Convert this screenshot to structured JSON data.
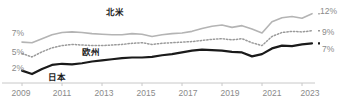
{
  "chart_data": {
    "type": "line",
    "title": "",
    "xlabel": "",
    "ylabel": "",
    "grid": false,
    "legend_position": "inline-annotations",
    "x": [
      2009,
      2009.5,
      2010,
      2010.5,
      2011,
      2011.5,
      2012,
      2012.5,
      2013,
      2013.5,
      2014,
      2014.5,
      2015,
      2015.5,
      2016,
      2016.5,
      2017,
      2017.5,
      2018,
      2018.5,
      2019,
      2019.5,
      2020,
      2020.5,
      2021,
      2021.5,
      2022,
      2022.5,
      2023,
      2023.5
    ],
    "xlim": [
      2009,
      2023.8
    ],
    "ylim": [
      0,
      13
    ],
    "x_tick_labels": [
      "2009",
      "2011",
      "2013",
      "2015",
      "2017",
      "2019",
      "2021",
      "2023"
    ],
    "x_tick_values": [
      2009,
      2011,
      2013,
      2015,
      2017,
      2019,
      2021,
      2023
    ],
    "y_axis_left_labels": [
      "7%",
      "5%",
      "2%"
    ],
    "y_axis_left_values": [
      7,
      5,
      2
    ],
    "y_axis_right_labels": [
      "12%",
      "9%",
      "7%"
    ],
    "y_axis_right_values": [
      12,
      9,
      7
    ],
    "series": [
      {
        "name": "北米",
        "label": "北米",
        "style": "solid",
        "color": "#b4b4b4",
        "width": 1.6,
        "end_label": "12%",
        "values": [
          7.0,
          6.9,
          7.6,
          8.3,
          8.7,
          8.8,
          8.7,
          8.5,
          8.4,
          8.3,
          8.3,
          8.5,
          8.4,
          8.0,
          8.3,
          8.5,
          8.6,
          8.9,
          9.4,
          9.8,
          10.0,
          9.6,
          9.9,
          9.3,
          8.6,
          10.6,
          11.3,
          11.5,
          11.2,
          12.0
        ]
      },
      {
        "name": "欧州",
        "label": "欧州",
        "style": "dotted",
        "color": "#9a9a9a",
        "width": 1.5,
        "end_label": "9%",
        "values": [
          5.0,
          4.4,
          5.3,
          6.0,
          6.4,
          6.6,
          6.5,
          6.4,
          6.4,
          6.5,
          6.6,
          6.8,
          6.9,
          6.6,
          6.8,
          6.9,
          7.0,
          7.1,
          7.3,
          7.5,
          7.6,
          7.4,
          7.6,
          6.9,
          6.4,
          8.0,
          8.7,
          8.9,
          8.8,
          9.0
        ]
      },
      {
        "name": "日本",
        "label": "日本",
        "style": "solid",
        "color": "#1a1a1a",
        "width": 2.2,
        "end_label": "7%",
        "values": [
          2.0,
          1.4,
          2.3,
          3.0,
          3.2,
          3.1,
          3.3,
          3.6,
          3.8,
          4.0,
          4.2,
          4.3,
          4.3,
          4.4,
          4.7,
          4.9,
          5.2,
          5.5,
          5.7,
          5.6,
          5.5,
          5.3,
          5.2,
          4.5,
          4.9,
          5.9,
          6.4,
          6.3,
          6.6,
          6.8
        ]
      }
    ],
    "annotations": [
      {
        "text": "北米",
        "series": "北米"
      },
      {
        "text": "欧州",
        "series": "欧州"
      },
      {
        "text": "日本",
        "series": "日本"
      }
    ]
  },
  "colors": {
    "north_america": "#b4b4b4",
    "europe": "#9a9a9a",
    "japan": "#1a1a1a",
    "axis": "#c8c8c8",
    "tick_text": "#8a8a8a",
    "background": "#ffffff"
  }
}
